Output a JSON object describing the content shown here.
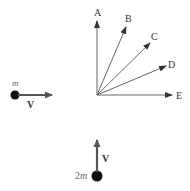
{
  "diagram": {
    "type": "collision-vector-diagram",
    "colors": {
      "arrow": "#555555",
      "ball": "#111111",
      "text": "#333333"
    },
    "particle_1": {
      "mass_label": "m",
      "velocity_label": "V",
      "direction": "right"
    },
    "particle_2": {
      "mass_label": "2m",
      "mass_coefficient": "2",
      "mass_symbol": "m",
      "velocity_label": "V",
      "direction": "up"
    },
    "choices": [
      {
        "label": "A",
        "direction": "up"
      },
      {
        "label": "B",
        "direction": "up-right steep"
      },
      {
        "label": "C",
        "direction": "45 degrees"
      },
      {
        "label": "D",
        "direction": "right shallow"
      },
      {
        "label": "E",
        "direction": "right"
      }
    ]
  }
}
